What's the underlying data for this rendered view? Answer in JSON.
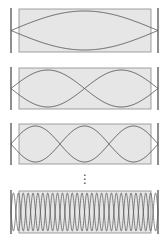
{
  "diagram": {
    "title": "",
    "colors": {
      "box_fill": "#e6e6e6",
      "box_stroke": "#8a8a8a",
      "wave_stroke": "#555555",
      "wall_stroke": "#444444",
      "ellipsis": "#444444"
    },
    "panels": [
      {
        "mode": 1,
        "half_wavelengths": 1,
        "y_top": 8,
        "y_bottom": 53
      },
      {
        "mode": 2,
        "half_wavelengths": 2,
        "y_top": 67,
        "y_bottom": 110
      },
      {
        "mode": 3,
        "half_wavelengths": 3,
        "y_top": 123,
        "y_bottom": 165
      },
      {
        "mode": "n",
        "half_wavelengths": 30,
        "y_top": 190,
        "y_bottom": 234
      }
    ],
    "ellipsis": "⋮"
  }
}
